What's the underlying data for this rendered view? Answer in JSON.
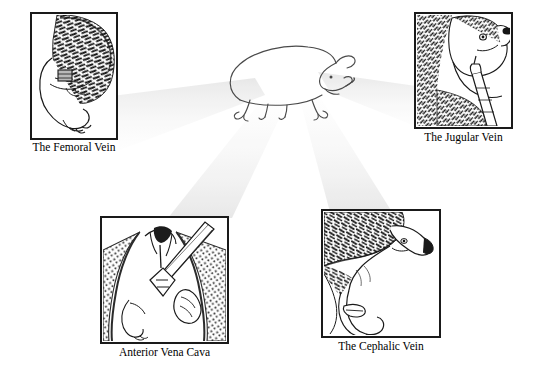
{
  "figure": {
    "kind": "scientific-illustration-plate",
    "background_color": "#ffffff",
    "ink_color": "#1a1a1a",
    "beam_color": "#ececec",
    "beam_color_light": "#f4f4f4",
    "center": {
      "label": "hedgehog-outline",
      "description": "side view outline drawing of a walking hedgehog"
    },
    "panels": [
      {
        "id": "femoral",
        "caption": "The Femoral Vein",
        "art": "hedgehog-hind-leg-with-spines",
        "x": 31,
        "y": 13,
        "w": 86,
        "h": 126,
        "caption_y": 141
      },
      {
        "id": "jugular",
        "caption": "The Jugular Vein",
        "art": "hedgehog-head-with-syringe",
        "x": 415,
        "y": 13,
        "w": 97,
        "h": 115,
        "caption_y": 131
      },
      {
        "id": "anterior-vena-cava",
        "caption": "Anterior Vena Cava",
        "art": "hedgehog-ventral-thorax-with-needle",
        "x": 101,
        "y": 217,
        "w": 127,
        "h": 126,
        "caption_y": 346
      },
      {
        "id": "cephalic",
        "caption": "The Cephalic Vein",
        "art": "hedgehog-foreleg-with-spines",
        "x": 322,
        "y": 210,
        "w": 118,
        "h": 127,
        "caption_y": 340
      }
    ]
  }
}
